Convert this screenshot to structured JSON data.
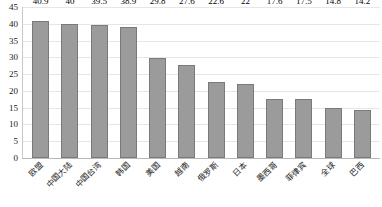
{
  "chart_data": {
    "type": "bar",
    "title": "",
    "subtitle": "",
    "xlabel": "",
    "ylabel": "",
    "ylim": [
      0,
      45
    ],
    "ytick_step": 5,
    "yticks": [
      45,
      40,
      35,
      30,
      25,
      20,
      15,
      10,
      5,
      0
    ],
    "grid": true,
    "legend": null,
    "legend_position": "none",
    "categories": [
      "欧盟",
      "中国大陆",
      "中国台湾",
      "韩国",
      "美国",
      "越南",
      "俄罗斯",
      "日本",
      "墨西哥",
      "菲律宾",
      "全球",
      "巴西"
    ],
    "values": [
      40.9,
      40,
      39.5,
      38.9,
      29.8,
      27.6,
      22.6,
      22,
      17.6,
      17.5,
      14.8,
      14.2
    ],
    "value_labels": [
      "40.9",
      "40",
      "39.5",
      "38.9",
      "29.8",
      "27.6",
      "22.6",
      "22",
      "17.6",
      "17.5",
      "14.8",
      "14.2"
    ]
  },
  "style": {
    "bar_fill": "#9b9b9b",
    "bar_border": "#7a7a7a",
    "grid_color": "#e6e6e6",
    "axis_color": "#b9b9b9",
    "text_color": "#1a1a1a",
    "background": "#ffffff"
  }
}
